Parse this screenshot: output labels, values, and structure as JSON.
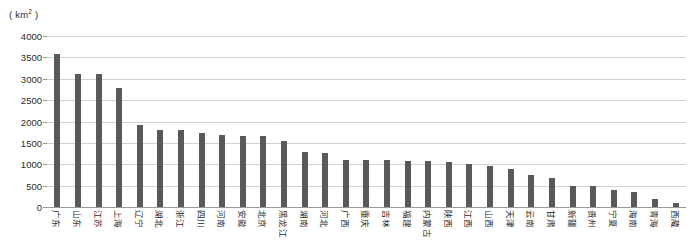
{
  "chart_data": {
    "type": "bar",
    "title": "",
    "subtitle": "",
    "unit_label": "( km2 )",
    "unit_label_base": "( km",
    "unit_label_sup": "2",
    "unit_label_tail": " )",
    "xlabel": "",
    "ylabel": "",
    "ylim": [
      0,
      4000
    ],
    "grid": true,
    "legend": "none",
    "y_ticks": [
      4000,
      3500,
      3000,
      2500,
      2000,
      1500,
      1000,
      500,
      0
    ],
    "categories": [
      "广东",
      "山东",
      "江苏",
      "上海",
      "辽宁",
      "湖北",
      "浙江",
      "四川",
      "河南",
      "安徽",
      "北京",
      "黑龙江",
      "湖南",
      "河北",
      "广西",
      "重庆",
      "吉林",
      "福建",
      "内蒙古",
      "陕西",
      "江西",
      "山西",
      "天津",
      "云南",
      "甘肃",
      "新疆",
      "贵州",
      "宁夏",
      "海南",
      "青海",
      "西藏"
    ],
    "values": [
      3570,
      3100,
      3100,
      2790,
      1930,
      1810,
      1800,
      1740,
      1690,
      1670,
      1660,
      1540,
      1290,
      1270,
      1110,
      1100,
      1090,
      1080,
      1070,
      1060,
      1010,
      960,
      880,
      760,
      690,
      500,
      480,
      400,
      360,
      190,
      90
    ]
  }
}
